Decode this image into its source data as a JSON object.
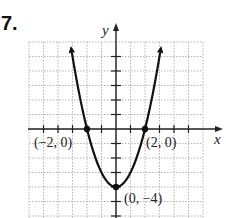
{
  "problem_number": "7.",
  "chart_data": {
    "type": "line",
    "title": "",
    "function": "y = x^2 - 4",
    "xlabel": "x",
    "ylabel": "y",
    "xlim": [
      -6,
      6
    ],
    "ylim": [
      -6,
      6
    ],
    "grid": true,
    "grid_style": "dotted",
    "tick_spacing": 1,
    "series": [
      {
        "name": "parabola",
        "x": [
          -3.16,
          -3,
          -2,
          -1,
          0,
          1,
          2,
          3,
          3.16
        ],
        "y": [
          6,
          5,
          0,
          -3,
          -4,
          -3,
          0,
          5,
          6
        ],
        "arrows_at_ends": true
      }
    ],
    "annotations": [
      {
        "point": [
          -2,
          0
        ],
        "label": "(−2, 0)"
      },
      {
        "point": [
          2,
          0
        ],
        "label": "(2, 0)"
      },
      {
        "point": [
          0,
          -4
        ],
        "label": "(0, −4)"
      }
    ]
  },
  "labels": {
    "x_axis": "x",
    "y_axis": "y",
    "pt_left": "(−2, 0)",
    "pt_right": "(2, 0)",
    "pt_vertex": "(0, −4)"
  },
  "colors": {
    "curve": "#111111",
    "grid": "#b5b5b5",
    "axis": "#222222"
  }
}
